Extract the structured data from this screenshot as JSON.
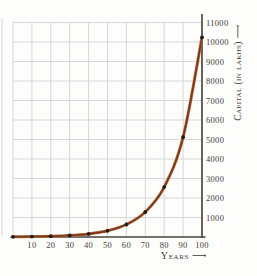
{
  "chart_data": {
    "type": "line",
    "title": "",
    "xlabel": "Years ⟶",
    "ylabel": "Capital (in lakhs) ⟶",
    "x": [
      0,
      10,
      20,
      30,
      40,
      50,
      60,
      70,
      80,
      90,
      100
    ],
    "values": [
      10,
      20,
      40,
      80,
      160,
      320,
      640,
      1280,
      2560,
      5120,
      10240
    ],
    "series_name": "capital-growth-curve",
    "x_ticks": [
      "10",
      "20",
      "30",
      "40",
      "50",
      "60",
      "70",
      "80",
      "90",
      "100"
    ],
    "y_ticks": [
      "1000",
      "2000",
      "3000",
      "4000",
      "5000",
      "6000",
      "7000",
      "8000",
      "9000",
      "10000",
      "11000"
    ],
    "xlim": [
      0,
      100
    ],
    "ylim": [
      0,
      11000
    ],
    "grid": "on",
    "y_axis_position": "right",
    "legend": "none",
    "colors": {
      "line_core": "#7c3a1c",
      "line_halo": "#b36f3d",
      "point": "#231d18",
      "grid": "#d7d7d7",
      "axis": "#46423c",
      "text": "#45403a",
      "background": "#fdfdfc"
    }
  }
}
